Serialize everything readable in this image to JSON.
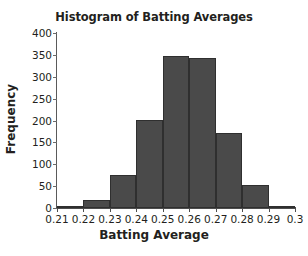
{
  "chart_data": {
    "type": "bar",
    "title": "Histogram of Batting Averages",
    "xlabel": "Batting Average",
    "ylabel": "Frequency",
    "grid": false,
    "legend": null,
    "bin_edges": [
      0.21,
      0.22,
      0.23,
      0.24,
      0.25,
      0.26,
      0.27,
      0.28,
      0.29,
      0.3
    ],
    "categories": [
      "0.21-0.22",
      "0.22-0.23",
      "0.23-0.24",
      "0.24-0.25",
      "0.25-0.26",
      "0.26-0.27",
      "0.27-0.28",
      "0.28-0.29",
      "0.29-0.30"
    ],
    "values": [
      1,
      18,
      76,
      202,
      348,
      342,
      172,
      53,
      5
    ],
    "xlim": [
      0.21,
      0.3
    ],
    "ylim": [
      0,
      400
    ],
    "xticks": [
      "0.21",
      "0.22",
      "0.23",
      "0.24",
      "0.25",
      "0.26",
      "0.27",
      "0.28",
      "0.29",
      "0.3"
    ],
    "xtick_values": [
      0.21,
      0.22,
      0.23,
      0.24,
      0.25,
      0.26,
      0.27,
      0.28,
      0.29,
      0.3
    ],
    "yticks": [
      "0",
      "50",
      "100",
      "150",
      "200",
      "250",
      "300",
      "350",
      "400"
    ],
    "ytick_values": [
      0,
      50,
      100,
      150,
      200,
      250,
      300,
      350,
      400
    ],
    "bar_color": "#4a4a4a",
    "bar_edge_color": "#2f2f2f",
    "background_color": "#ffffff",
    "text_color": "#231f20"
  }
}
